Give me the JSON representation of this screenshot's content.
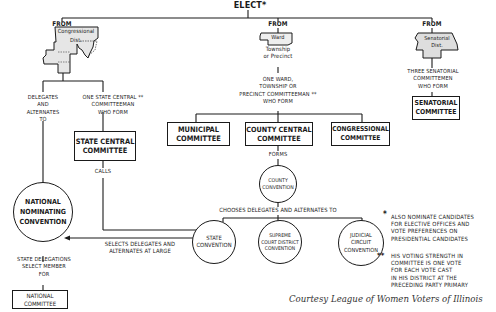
{
  "title": "ELECT*",
  "sources": [
    {
      "from_label": "FROM",
      "map_label": "Congressional\nDist.",
      "desc": "DELEGATES\nAND\nALTERNATES\nTO"
    },
    {
      "from_label": "FROM",
      "map_label": "Ward",
      "map_sub": "Township\nor Precinct",
      "desc": "ONE WARD,\nTOWNSHIP OR\nPRECINCT COMMITTEEMAN **\nWHO FORM"
    },
    {
      "from_label": "FROM",
      "map_label": "Senatorial\nDist.",
      "desc": "THREE SENATORIAL\nCOMMITTEMEN\nWHO FORM"
    }
  ],
  "congressional_branch": {
    "state_central_desc": "ONE STATE CENTRAL **\nCOMMITTEEMAN\nWHO FORM"
  },
  "boxes": {
    "state_central": "STATE CENTRAL\nCOMMITTEE",
    "municipal": "MUNICIPAL\nCOMMITTEE",
    "county_central": "COUNTY CENTRAL\nCOMMITTEE",
    "congressional": "CONGRESSIONAL\nCOMMITTEE",
    "senatorial": "SENATORIAL\nCOMMITTEE",
    "national_committee": "NATIONAL\nCOMMITTEE"
  },
  "circles": {
    "national_convention": "NATIONAL\nNOMINATING\nCONVENTION",
    "county_convention": "COUNTY\nCONVENTION",
    "state_convention": "STATE\nCONVENTION",
    "supreme_court": "SUPREME\nCOURT DISTRICT\nCONVENTION",
    "judicial_circuit": "JUDICIAL\nCIRCUIT\nCONVENTION"
  },
  "edge_labels": {
    "calls": "CALLS",
    "forms": "FORMS",
    "chooses": "CHOOSES DELEGATES AND ALTERNATES TO",
    "selects": "SELECTS DELEGATES AND\nALTERNATES AT LARGE",
    "state_delegations": "STATE DELEGATIONS\nSELECT MEMBER\nFOR"
  },
  "footnotes": [
    {
      "marker": "*",
      "text": "ALSO NOMINATE CANDIDATES\nFOR ELECTIVE OFFICES AND\nVOTE PREFERENCES ON\nPRESIDENTIAL CANDIDATES"
    },
    {
      "marker": "**",
      "text": "HIS VOTING STRENGTH IN\nCOMMITTEE IS ONE VOTE\nFOR EACH VOTE CAST\nIN HIS DISTRICT AT THE\nPRECEDING PARTY PRIMARY"
    }
  ],
  "credit": "Courtesy League of Women Voters of Illinois"
}
